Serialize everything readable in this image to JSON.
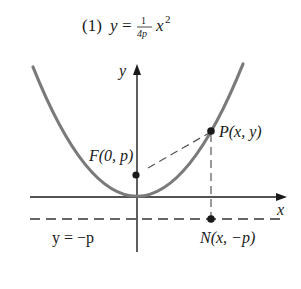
{
  "title": {
    "number": "(1)",
    "lhs": "y",
    "eq": "=",
    "frac_num": "1",
    "frac_den": "4p",
    "var": "x",
    "exp": "2"
  },
  "axes": {
    "x_label": "x",
    "y_label": "y"
  },
  "points": {
    "focus": "F(0, p)",
    "point": "P(x, y)",
    "foot": "N(x, −p)"
  },
  "directrix_label": "y = −p",
  "colors": {
    "parabola": "#7a7a7a",
    "axes": "#1a1a1a",
    "dashes": "#444444",
    "points": "#1a1a1a"
  }
}
